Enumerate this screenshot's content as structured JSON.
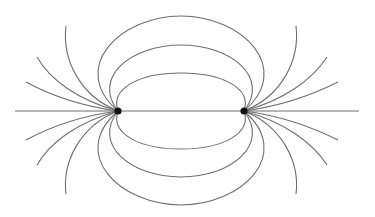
{
  "diagram": {
    "type": "electric-dipole-field-lines",
    "charges": [
      {
        "id": "left-charge",
        "label": ""
      },
      {
        "id": "right-charge",
        "label": ""
      }
    ],
    "closed_loops_above_axis": 3,
    "closed_loops_below_axis": 3,
    "open_lines_per_charge_per_side": 3,
    "colors": {
      "field_line": "#6e6e6e",
      "charge": "#111111",
      "background": "#ffffff"
    }
  }
}
